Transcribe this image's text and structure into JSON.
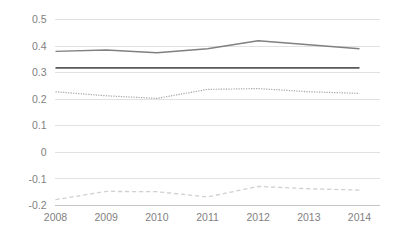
{
  "chart_data": {
    "type": "line",
    "title": "",
    "subtitle": "",
    "xlabel": "",
    "ylabel": "",
    "categories": [
      "2008",
      "2009",
      "2010",
      "2011",
      "2012",
      "2013",
      "2014"
    ],
    "x": [
      2008,
      2009,
      2010,
      2011,
      2012,
      2013,
      2014
    ],
    "xlim": [
      2008,
      2014
    ],
    "ylim": [
      -0.2,
      0.5
    ],
    "y_ticks": [
      0.5,
      0.4,
      0.3,
      0.2,
      0.1,
      0,
      -0.1,
      -0.2
    ],
    "y_tick_labels": [
      "0.5",
      "0.4",
      "0.3",
      "0.2",
      "0.1",
      "0",
      "-0.1",
      "-0.2"
    ],
    "grid": true,
    "legend": "none",
    "series": [
      {
        "name": "series-1",
        "style": "solid",
        "color": "#808080",
        "width": 1.4,
        "values": [
          0.38,
          0.385,
          0.375,
          0.39,
          0.42,
          0.405,
          0.39
        ]
      },
      {
        "name": "series-2",
        "style": "solid",
        "color": "#595959",
        "width": 1.6,
        "values": [
          0.318,
          0.318,
          0.318,
          0.318,
          0.318,
          0.318,
          0.318
        ]
      },
      {
        "name": "series-3",
        "style": "dotted",
        "color": "#a6a6a6",
        "width": 1.2,
        "values": [
          0.228,
          0.213,
          0.203,
          0.237,
          0.24,
          0.228,
          0.222
        ]
      },
      {
        "name": "series-4",
        "style": "dashed",
        "color": "#d0d0d0",
        "width": 1.3,
        "values": [
          -0.178,
          -0.147,
          -0.148,
          -0.168,
          -0.128,
          -0.137,
          -0.142
        ]
      }
    ]
  },
  "axis": {
    "gridline_color": "#d9d9d9",
    "tick_label_color": "#7f7f7f"
  }
}
